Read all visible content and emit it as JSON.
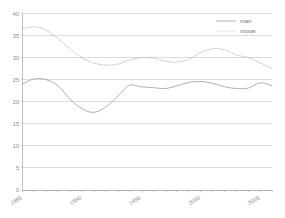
{
  "chart_data": {
    "type": "line",
    "title": "",
    "xlabel": "",
    "ylabel": "",
    "xlim": [
      1985,
      2006
    ],
    "ylim": [
      0,
      40
    ],
    "grid": true,
    "legend_position": "top-right",
    "y_ticks": [
      0,
      5,
      10,
      15,
      20,
      25,
      30,
      35,
      40
    ],
    "y_tick_labels": [
      "0",
      "5",
      "10",
      "15",
      "20",
      "25",
      "30",
      "35",
      "40"
    ],
    "x_ticks": [
      1985,
      1990,
      1995,
      2000,
      2005
    ],
    "x_tick_labels": [
      "1985",
      "1990",
      "1995",
      "2000",
      "2005"
    ],
    "x": [
      1985,
      1986,
      1987,
      1988,
      1989,
      1990,
      1991,
      1992,
      1993,
      1994,
      1995,
      1996,
      1997,
      1998,
      1999,
      2000,
      2001,
      2002,
      2003,
      2004,
      2005,
      2006
    ],
    "series": [
      {
        "name": "man",
        "style": "solid",
        "color": "#9a9a9a",
        "values": [
          24.0,
          25.2,
          25.0,
          23.6,
          20.6,
          18.4,
          17.6,
          18.8,
          21.2,
          23.7,
          23.4,
          23.2,
          23.0,
          23.6,
          24.4,
          24.6,
          24.2,
          23.4,
          23.0,
          23.1,
          24.3,
          23.6
        ]
      },
      {
        "name": "vrouw",
        "style": "dotted",
        "color": "#b0b0b0",
        "values": [
          36.5,
          37.0,
          36.2,
          34.3,
          32.0,
          30.0,
          28.8,
          28.3,
          28.5,
          29.4,
          30.0,
          29.9,
          29.2,
          29.0,
          29.6,
          31.2,
          32.0,
          31.8,
          30.6,
          30.0,
          28.8,
          27.6
        ]
      }
    ]
  },
  "legend": {
    "entries": [
      {
        "label": "man",
        "marker": "solid-line-swatch"
      },
      {
        "label": "vrouw",
        "marker": "dotted-line-swatch"
      }
    ]
  },
  "colors": {
    "man_line": "#9a9a9a",
    "vrouw_line": "#b0b0b0",
    "gridline": "#b9b9b9",
    "axis": "#9a9a9a",
    "tick_text": "#8a8a8a",
    "background": "#ffffff"
  }
}
